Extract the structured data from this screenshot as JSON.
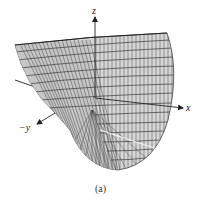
{
  "figure": {
    "caption": "(a)",
    "axes": {
      "z": "z",
      "x": "x",
      "y": "−y"
    },
    "colors": {
      "mesh_line": "#333333",
      "surface_fill": "#d8d8d8",
      "axis": "#222222",
      "background": "#ffffff"
    }
  }
}
